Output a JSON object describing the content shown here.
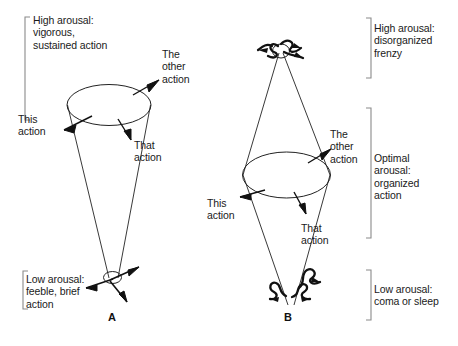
{
  "figure": {
    "caption_letters": [
      "A",
      "B"
    ],
    "panel_a": {
      "letter": "A",
      "bracket_top_label": "High arousal:\nvigorous,\nsustained action",
      "bracket_bottom_label": "Low arousal:\nfeeble, brief\naction",
      "arrow_labels": {
        "this": "This\naction",
        "other": "The\nother\naction",
        "that": "That\naction"
      },
      "shape": "inverted cone, wide ellipse at top, small ellipse at apex",
      "arousal_direction": "high at top, low at bottom"
    },
    "panel_b": {
      "letter": "B",
      "bracket_top_label": "High arousal:\ndisorganized\nfrenzy",
      "bracket_middle_label": "Optimal\narousal:\norganized\naction",
      "bracket_bottom_label": "Low arousal:\ncoma or sleep",
      "arrow_labels": {
        "this": "This\naction",
        "other": "The\nother\naction",
        "that": "That\naction"
      },
      "shape": "double cone (hourglass), ellipse at middle, squiggly arrows at both apexes",
      "arousal_direction": "high at top, optimal at middle, low at bottom"
    },
    "colors": {
      "ink": "#1a1a1a",
      "line": "#222222",
      "bracket": "#888888",
      "background": "#ffffff"
    }
  }
}
